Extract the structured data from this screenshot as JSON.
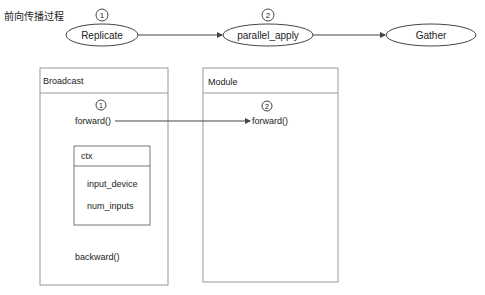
{
  "title": "前向传播过程",
  "pipeline": {
    "nodes": [
      {
        "label": "Replicate",
        "step": "1"
      },
      {
        "label": "parallel_apply",
        "step": "2"
      },
      {
        "label": "Gather",
        "step": ""
      }
    ]
  },
  "broadcast": {
    "title": "Broadcast",
    "step": "1",
    "forward": "forward()",
    "backward": "backward()",
    "ctx": {
      "title": "ctx",
      "fields": [
        "input_device",
        "num_inputs"
      ]
    }
  },
  "module": {
    "title": "Module",
    "step": "2",
    "forward": "forward()"
  },
  "colors": {
    "stroke": "#555555",
    "box_stroke": "#999999",
    "text": "#222222"
  }
}
